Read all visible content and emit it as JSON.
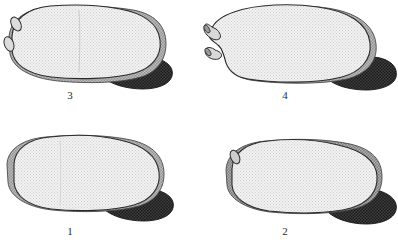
{
  "plate": {
    "title": "Specimen comparison plate",
    "background_color": "#ffffff",
    "width": 398,
    "height": 249,
    "colors": {
      "body_fill": "#e9e9e9",
      "body_stipple": "#c8c8c8",
      "rim_gray": "#a8a8a8",
      "rim_gray_dark": "#8d8d8d",
      "dark_appendage": "#3a3a3a",
      "dark_appendage_stipple": "#1e1e1e",
      "outline": "#2b2b2b",
      "label_color": "#2b2b2b"
    }
  },
  "figures": [
    {
      "id": "figure-3",
      "label": "3",
      "position": "top-left",
      "label_x": 70,
      "label_y": 90,
      "description": "Rounded bean-shaped valve with two small oval tubercles on the anterior (left) margin, pale stippled body, narrow gray rim along ventral and posterior margins, and a dark crescentic appendage at the posterior-ventral corner.",
      "features": {
        "projections": 2,
        "projection_type": "oval-tubercle",
        "rim": "narrow-gray",
        "appendage": "dark-crescent"
      }
    },
    {
      "id": "figure-4",
      "label": "4",
      "position": "top-right",
      "label_x": 285,
      "label_y": 90,
      "description": "Elongate valve bearing two tubular anterior projections separated by a deep rounded notch; pale stippled body, broad gray band along posterior margin, and a dark crescentic appendage at the posterior-ventral corner.",
      "features": {
        "projections": 2,
        "projection_type": "tubular-siphon",
        "rim": "broad-gray-posterior",
        "appendage": "dark-crescent"
      }
    },
    {
      "id": "figure-1",
      "label": "1",
      "position": "bottom-left",
      "label_x": 70,
      "label_y": 227,
      "description": "Smooth sub-rectangular valve lacking projections, pale stippled body with an even gray rim along the anterior and ventral margins, and a dark crescentic appendage at the posterior-ventral corner.",
      "features": {
        "projections": 0,
        "projection_type": "none",
        "rim": "even-gray",
        "appendage": "dark-crescent"
      }
    },
    {
      "id": "figure-2",
      "label": "2",
      "position": "bottom-right",
      "label_x": 285,
      "label_y": 227,
      "description": "Oval valve with a single small oval tubercle at the antero-dorsal corner, pale stippled body, coarse darker-gray textured rim along the anterior and ventral margins, and a dark crescentic appendage at the posterior-ventral corner.",
      "features": {
        "projections": 1,
        "projection_type": "oval-tubercle",
        "rim": "coarse-gray-textured",
        "appendage": "dark-crescent"
      }
    }
  ]
}
